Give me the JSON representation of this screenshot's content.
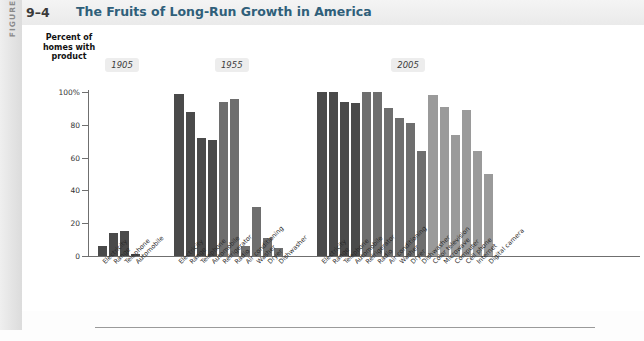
{
  "figure": {
    "sidebar_word": "FIGURE",
    "number": "9–4",
    "title": "The Fruits of Long-Run Growth in America"
  },
  "axis": {
    "y_title_line1": "Percent of",
    "y_title_line2": "homes with",
    "y_title_line3": "product",
    "y_ticks": [
      "100%",
      "80",
      "60",
      "40",
      "20",
      "0"
    ]
  },
  "groups": [
    {
      "year": "1905"
    },
    {
      "year": "1955"
    },
    {
      "year": "2005"
    }
  ],
  "colors": {
    "bar_dark": "#4a4a4a",
    "bar_mid": "#6e6e6e",
    "bar_light": "#9a9a9a",
    "axis": "#6f6f6f",
    "title": "#2f5f7a",
    "pill_bg": "#ededed"
  },
  "chart_data": {
    "type": "bar",
    "title": "The Fruits of Long-Run Growth in America",
    "xlabel": "",
    "ylabel": "Percent of homes with product",
    "ylim": [
      0,
      100
    ],
    "grid": false,
    "legend": "none",
    "yticks": [
      0,
      20,
      40,
      60,
      80,
      100
    ],
    "groups": [
      {
        "year": "1905",
        "categories": [
          "Electricity",
          "Range",
          "Telephone",
          "Automobile"
        ],
        "values": [
          6,
          14,
          15,
          1
        ],
        "shades": [
          "dark",
          "dark",
          "dark",
          "dark"
        ]
      },
      {
        "year": "1955",
        "categories": [
          "Electricity",
          "Range",
          "Telephone",
          "Automobile",
          "Refrigerator",
          "Radio",
          "Air conditioning",
          "Washer",
          "Dryer",
          "Dishwasher"
        ],
        "values": [
          99,
          88,
          72,
          71,
          94,
          96,
          6,
          30,
          11,
          5
        ],
        "shades": [
          "dark",
          "dark",
          "dark",
          "dark",
          "mid",
          "mid",
          "mid",
          "mid",
          "mid",
          "mid"
        ]
      },
      {
        "year": "2005",
        "categories": [
          "Electricity",
          "Range",
          "Telephone",
          "Automobile",
          "Refrigerator",
          "Radio",
          "Air conditioning",
          "Washer",
          "Dryer",
          "Dishwasher",
          "Color television",
          "Microwave",
          "Computer",
          "Cell phone",
          "Internet",
          "Digital camera"
        ],
        "values": [
          100,
          100,
          94,
          93,
          100,
          100,
          90,
          84,
          81,
          64,
          98,
          91,
          74,
          89,
          64,
          50
        ],
        "shades": [
          "dark",
          "dark",
          "dark",
          "dark",
          "mid",
          "mid",
          "mid",
          "mid",
          "mid",
          "mid",
          "light",
          "light",
          "light",
          "light",
          "light",
          "light"
        ]
      }
    ]
  }
}
